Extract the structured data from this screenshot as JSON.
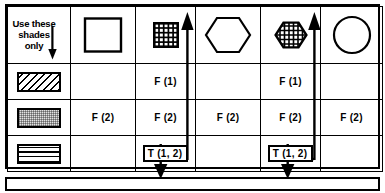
{
  "diagram": {
    "colors": {
      "ink": "#000000",
      "paper": "#ffffff",
      "dot_fill": "#e2e2e2"
    },
    "legend": {
      "text": "Use these shades only",
      "line1": "Use these",
      "line2": "shades",
      "line3": "only",
      "arrow_icon": "arrow-down-icon"
    },
    "column_headers": [
      {
        "id": "square-plain",
        "icon": "square-outline-icon",
        "label": "square"
      },
      {
        "id": "square-grid",
        "icon": "square-grid-filled-icon",
        "label": "grid square"
      },
      {
        "id": "hexagon-plain",
        "icon": "hexagon-outline-icon",
        "label": "hexagon"
      },
      {
        "id": "hexagon-grid",
        "icon": "hexagon-grid-filled-icon",
        "label": "grid hexagon"
      },
      {
        "id": "circle-plain",
        "icon": "circle-outline-icon",
        "label": "circle"
      }
    ],
    "row_headers": [
      {
        "id": "shade-diagonal",
        "icon": "swatch-diagonal-hatch-icon",
        "label": "diagonal hatch"
      },
      {
        "id": "shade-stipple",
        "icon": "swatch-stipple-icon",
        "label": "stipple"
      },
      {
        "id": "shade-crosshatch",
        "icon": "swatch-grid-icon",
        "label": "crosshatch grid"
      }
    ],
    "cells": [
      [
        {
          "text": "",
          "boxed": false
        },
        {
          "text": "F (1)",
          "boxed": false
        },
        {
          "text": "",
          "boxed": false
        },
        {
          "text": "F (1)",
          "boxed": false
        },
        {
          "text": "",
          "boxed": false
        }
      ],
      [
        {
          "text": "F (2)",
          "boxed": false
        },
        {
          "text": "F (2)",
          "boxed": false
        },
        {
          "text": "F (2)",
          "boxed": false
        },
        {
          "text": "F (2)",
          "boxed": false
        },
        {
          "text": "F (2)",
          "boxed": false
        }
      ],
      [
        {
          "text": "",
          "boxed": false
        },
        {
          "text": "T (1, 2)",
          "boxed": true
        },
        {
          "text": "",
          "boxed": false
        },
        {
          "text": "T (1, 2)",
          "boxed": true
        },
        {
          "text": "",
          "boxed": false
        }
      ]
    ],
    "connectors": [
      {
        "id": "connector-left",
        "from": "cell-r3-c2",
        "up_arrow": "arrow-up-icon",
        "down_arrow": "arrow-down-icon"
      },
      {
        "id": "connector-right",
        "from": "cell-r3-c4",
        "up_arrow": "arrow-up-icon",
        "down_arrow": "arrow-down-icon"
      }
    ],
    "bottom_bar": {
      "label": ""
    }
  }
}
